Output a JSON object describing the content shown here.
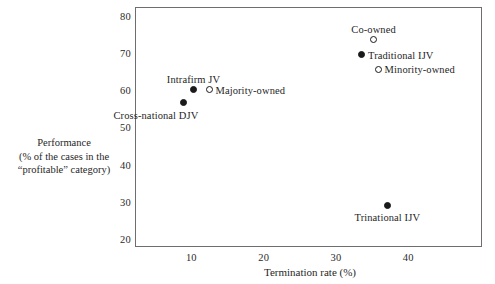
{
  "chart_data": {
    "type": "scatter",
    "title": "",
    "xlabel": "Termination rate (%)",
    "ylabel_lines": [
      "Performance",
      "(% of the cases in the",
      "“profitable” category)"
    ],
    "xlim": [
      2.2,
      50.2
    ],
    "ylim": [
      18.2,
      82.8
    ],
    "xticks": [
      10,
      20,
      30,
      40
    ],
    "xtick_labels": [
      "10",
      "20",
      "30",
      "40"
    ],
    "yticks": [
      20,
      30,
      40,
      50,
      60,
      70,
      80
    ],
    "ytick_labels": [
      "20",
      "30",
      "40",
      "50",
      "60",
      "70",
      "80"
    ],
    "grid": false,
    "legend": "none",
    "frame": true,
    "marker_styles": {
      "filled": "filled-circle",
      "open": "open-circle"
    },
    "points": [
      {
        "label": "Cross-national DJV",
        "x": 8.9,
        "y": 57,
        "marker": "filled",
        "label_position": "below-left"
      },
      {
        "label": "Intrafirm JV",
        "x": 10.3,
        "y": 60.5,
        "marker": "filled",
        "label_position": "above"
      },
      {
        "label": "Majority-owned",
        "x": 12.5,
        "y": 60.5,
        "marker": "open",
        "label_position": "right"
      },
      {
        "label": "Co-owned",
        "x": 35.2,
        "y": 74,
        "marker": "open",
        "label_position": "above"
      },
      {
        "label": "Traditional IJV",
        "x": 33.6,
        "y": 70,
        "marker": "filled",
        "label_position": "right"
      },
      {
        "label": "Minority-owned",
        "x": 35.9,
        "y": 66,
        "marker": "open",
        "label_position": "right"
      },
      {
        "label": "Trinational IJV",
        "x": 37.1,
        "y": 29.5,
        "marker": "filled",
        "label_position": "below"
      }
    ]
  },
  "colors": {
    "background": "#ffffff",
    "frame": "#6e6e6e",
    "marker": "#1a1a1a",
    "text": "#1f1f1f"
  }
}
